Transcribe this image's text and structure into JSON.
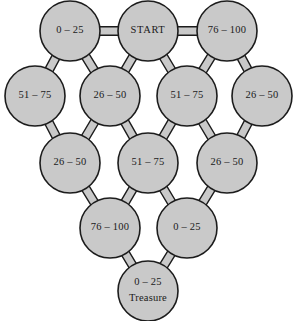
{
  "diagram": {
    "type": "network-graph",
    "shape": "pyramid-lattice",
    "background_color": "#ffffff",
    "node_fill_color": "#c9c9c9",
    "node_stroke_color": "#1c1c1c",
    "edge_fill_color": "#c9c9c9",
    "edge_stroke_color": "#1c1c1c",
    "text_color": "#1a1a1a",
    "node_radius": 30,
    "nodes": [
      {
        "id": "r1c1",
        "row": 1,
        "label": "0 – 25",
        "sub": "",
        "cx": 70,
        "cy": 31
      },
      {
        "id": "r1c2",
        "row": 1,
        "label": "START",
        "sub": "",
        "cx": 148,
        "cy": 31
      },
      {
        "id": "r1c3",
        "row": 1,
        "label": "76 – 100",
        "sub": "",
        "cx": 227,
        "cy": 31
      },
      {
        "id": "r2c1",
        "row": 2,
        "label": "51 – 75",
        "sub": "",
        "cx": 35,
        "cy": 96
      },
      {
        "id": "r2c2",
        "row": 2,
        "label": "26 – 50",
        "sub": "",
        "cx": 110,
        "cy": 96
      },
      {
        "id": "r2c3",
        "row": 2,
        "label": "51 – 75",
        "sub": "",
        "cx": 187,
        "cy": 96
      },
      {
        "id": "r2c4",
        "row": 2,
        "label": "26 – 50",
        "sub": "",
        "cx": 262,
        "cy": 96
      },
      {
        "id": "r3c1",
        "row": 3,
        "label": "26 – 50",
        "sub": "",
        "cx": 70,
        "cy": 163
      },
      {
        "id": "r3c2",
        "row": 3,
        "label": "51 – 75",
        "sub": "",
        "cx": 148,
        "cy": 163
      },
      {
        "id": "r3c3",
        "row": 3,
        "label": "26 – 50",
        "sub": "",
        "cx": 227,
        "cy": 163
      },
      {
        "id": "r4c1",
        "row": 4,
        "label": "76 – 100",
        "sub": "",
        "cx": 110,
        "cy": 228
      },
      {
        "id": "r4c2",
        "row": 4,
        "label": "0 – 25",
        "sub": "",
        "cx": 187,
        "cy": 228
      },
      {
        "id": "r5c1",
        "row": 5,
        "label": "0 – 25",
        "sub": "Treasure",
        "cx": 148,
        "cy": 291
      }
    ],
    "edges": [
      {
        "from": "r1c1",
        "to": "r1c2"
      },
      {
        "from": "r1c2",
        "to": "r1c3"
      },
      {
        "from": "r1c1",
        "to": "r2c1"
      },
      {
        "from": "r1c1",
        "to": "r2c2"
      },
      {
        "from": "r1c2",
        "to": "r2c2"
      },
      {
        "from": "r1c2",
        "to": "r2c3"
      },
      {
        "from": "r1c3",
        "to": "r2c3"
      },
      {
        "from": "r1c3",
        "to": "r2c4"
      },
      {
        "from": "r2c1",
        "to": "r3c1"
      },
      {
        "from": "r2c2",
        "to": "r3c1"
      },
      {
        "from": "r2c2",
        "to": "r3c2"
      },
      {
        "from": "r2c3",
        "to": "r3c2"
      },
      {
        "from": "r2c3",
        "to": "r3c3"
      },
      {
        "from": "r2c4",
        "to": "r3c3"
      },
      {
        "from": "r3c1",
        "to": "r4c1"
      },
      {
        "from": "r3c2",
        "to": "r4c1"
      },
      {
        "from": "r3c2",
        "to": "r4c2"
      },
      {
        "from": "r3c3",
        "to": "r4c2"
      },
      {
        "from": "r4c1",
        "to": "r5c1"
      },
      {
        "from": "r4c2",
        "to": "r5c1"
      }
    ]
  }
}
